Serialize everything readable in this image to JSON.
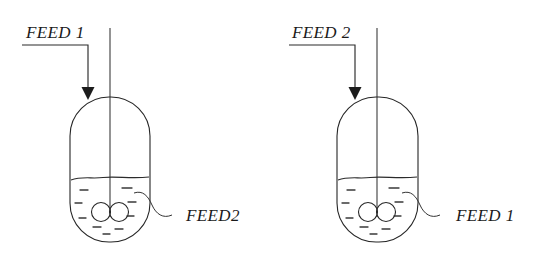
{
  "diagram": {
    "background_color": "#ffffff",
    "line_color": "#262626",
    "units": {
      "width": 551,
      "height": 265
    },
    "reactors": [
      {
        "id": "left-reactor",
        "inlet_label": "FEED 1",
        "liquid_label": "FEED2",
        "vessel": {
          "x": 70,
          "y": 97,
          "width": 80,
          "height": 145,
          "corner_radius": 39
        },
        "liquid_level_y": 178,
        "shaft": {
          "x": 110,
          "top_y": 28,
          "bottom_y": 212
        },
        "impeller": {
          "center_x": 110,
          "center_y": 212,
          "radius": 9.5
        },
        "feed_line": {
          "start_x": 22,
          "horizontal_y": 45,
          "corner_x": 88,
          "arrow_tip_y": 99
        },
        "leader": {
          "start_x": 143,
          "start_y": 197,
          "end_x": 178,
          "end_y": 215
        },
        "inlet_label_pos": {
          "x": 26,
          "y": 38
        },
        "liquid_label_pos": {
          "x": 186,
          "y": 221
        }
      },
      {
        "id": "right-reactor",
        "inlet_label": "FEED 2",
        "liquid_label": "FEED 1",
        "vessel": {
          "x": 337,
          "y": 97,
          "width": 81,
          "height": 145,
          "corner_radius": 39
        },
        "liquid_level_y": 178,
        "shaft": {
          "x": 377,
          "top_y": 28,
          "bottom_y": 212
        },
        "impeller": {
          "center_x": 377,
          "center_y": 212,
          "radius": 9.5
        },
        "feed_line": {
          "start_x": 289,
          "horizontal_y": 45,
          "corner_x": 355,
          "arrow_tip_y": 99
        },
        "leader": {
          "start_x": 411,
          "start_y": 197,
          "end_x": 446,
          "end_y": 215
        },
        "inlet_label_pos": {
          "x": 292,
          "y": 38
        },
        "liquid_label_pos": {
          "x": 456,
          "y": 221
        }
      }
    ],
    "liquid_dash_marks": [
      {
        "x": 84,
        "y": 190,
        "w": 7
      },
      {
        "x": 125,
        "y": 188,
        "w": 9
      },
      {
        "x": 78,
        "y": 203,
        "w": 7
      },
      {
        "x": 130,
        "y": 202,
        "w": 7
      },
      {
        "x": 82,
        "y": 218,
        "w": 7
      },
      {
        "x": 128,
        "y": 216,
        "w": 6
      },
      {
        "x": 96,
        "y": 226,
        "w": 7
      },
      {
        "x": 118,
        "y": 228,
        "w": 7
      },
      {
        "x": 105,
        "y": 233,
        "w": 6
      }
    ]
  }
}
